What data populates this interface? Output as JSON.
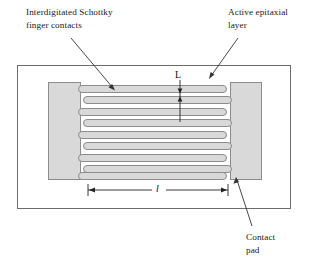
{
  "figure": {
    "kind": "interdigitated-schottky-detector-layout",
    "background_color": "#ffffff",
    "line_color": "#555555",
    "text_color": "#1a1a1a",
    "metal_fill_color": "#d9d9d9",
    "metal_stroke_color": "#8c8c8c"
  },
  "callouts": {
    "fingers": "Interdigitated Schottky\nfinger contacts",
    "epitaxial_layer": "Active epitaxial\nlayer",
    "contact_pad": "Contact\npad"
  },
  "dimensions": {
    "finger_pitch_symbol": "L",
    "finger_length_symbol": "l"
  },
  "structure": {
    "outer_frame": {
      "x": 17,
      "y": 65,
      "width": 274,
      "height": 144
    },
    "left_pad": {
      "x": 48,
      "y": 82,
      "width": 33,
      "height": 98
    },
    "right_pad": {
      "x": 230,
      "y": 82,
      "width": 32,
      "height": 98
    },
    "left_finger_count": 5,
    "right_finger_count": 4,
    "finger_thickness": 7,
    "finger_pitch": 10
  }
}
